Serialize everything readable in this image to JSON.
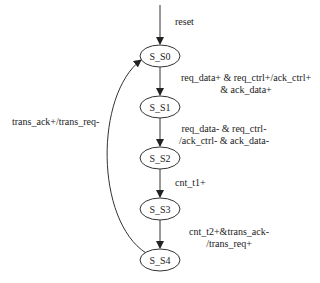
{
  "diagram": {
    "type": "state-machine",
    "entry_label": "reset",
    "nodes": [
      {
        "id": "S_S0",
        "label": "S_S0"
      },
      {
        "id": "S_S1",
        "label": "S_S1"
      },
      {
        "id": "S_S2",
        "label": "S_S2"
      },
      {
        "id": "S_S3",
        "label": "S_S3"
      },
      {
        "id": "S_S4",
        "label": "S_S4"
      }
    ],
    "edges": [
      {
        "from": "S_S0",
        "to": "S_S1",
        "label_lines": [
          "req_data+ & req_ctrl+/ack_ctrl+",
          "& ack_data+"
        ]
      },
      {
        "from": "S_S1",
        "to": "S_S2",
        "label_lines": [
          "req_data- & req_ctrl-",
          "/ack_ctrl- & ack_data-"
        ]
      },
      {
        "from": "S_S2",
        "to": "S_S3",
        "label_lines": [
          "cnt_t1+"
        ]
      },
      {
        "from": "S_S3",
        "to": "S_S4",
        "label_lines": [
          "cnt_t2+&trans_ack-",
          "/trans_req+"
        ]
      },
      {
        "from": "S_S4",
        "to": "S_S0",
        "label_lines": [
          "trans_ack+/trans_req-"
        ]
      }
    ]
  }
}
